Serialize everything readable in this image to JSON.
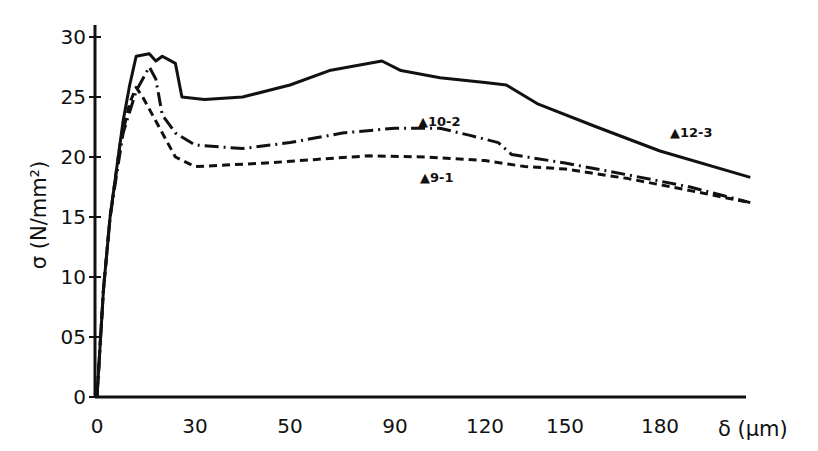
{
  "chart_data": {
    "type": "line",
    "title": "",
    "xlabel": "δ (μm)",
    "ylabel": "σ (N/mm²)",
    "x_ticks": [
      "0",
      "30",
      "50",
      "90",
      "120",
      "150",
      "180"
    ],
    "y_ticks": [
      "0",
      "05",
      "10",
      "15",
      "20",
      "25",
      "30"
    ],
    "ylim": [
      0,
      3.0
    ],
    "grid": false,
    "legend": "inline labels",
    "series": [
      {
        "name": "▲12-3",
        "style": "solid",
        "points": [
          [
            0,
            0.0
          ],
          [
            2,
            0.9
          ],
          [
            4,
            1.5
          ],
          [
            8,
            2.3
          ],
          [
            10,
            2.6
          ],
          [
            12,
            2.84
          ],
          [
            16,
            2.86
          ],
          [
            18,
            2.8
          ],
          [
            20,
            2.84
          ],
          [
            24,
            2.78
          ],
          [
            26,
            2.5
          ],
          [
            32,
            2.48
          ],
          [
            40,
            2.5
          ],
          [
            50,
            2.6
          ],
          [
            65,
            2.72
          ],
          [
            85,
            2.8
          ],
          [
            92,
            2.72
          ],
          [
            105,
            2.66
          ],
          [
            120,
            2.62
          ],
          [
            128,
            2.6
          ],
          [
            140,
            2.44
          ],
          [
            160,
            2.25
          ],
          [
            180,
            2.05
          ],
          [
            195,
            1.83
          ]
        ]
      },
      {
        "name": "▲10-2",
        "style": "dash-dot",
        "points": [
          [
            0,
            0.0
          ],
          [
            2,
            0.9
          ],
          [
            4,
            1.5
          ],
          [
            8,
            2.2
          ],
          [
            12,
            2.55
          ],
          [
            16,
            2.75
          ],
          [
            18,
            2.65
          ],
          [
            20,
            2.35
          ],
          [
            24,
            2.2
          ],
          [
            30,
            2.1
          ],
          [
            40,
            2.07
          ],
          [
            50,
            2.12
          ],
          [
            70,
            2.2
          ],
          [
            90,
            2.24
          ],
          [
            105,
            2.24
          ],
          [
            115,
            2.18
          ],
          [
            125,
            2.12
          ],
          [
            130,
            2.02
          ],
          [
            150,
            1.95
          ],
          [
            170,
            1.85
          ],
          [
            185,
            1.75
          ],
          [
            195,
            1.62
          ]
        ]
      },
      {
        "name": "▲9-1",
        "style": "dashed",
        "points": [
          [
            0,
            0.0
          ],
          [
            2,
            0.9
          ],
          [
            4,
            1.5
          ],
          [
            7,
            2.1
          ],
          [
            10,
            2.45
          ],
          [
            12,
            2.58
          ],
          [
            14,
            2.5
          ],
          [
            18,
            2.3
          ],
          [
            24,
            2.0
          ],
          [
            30,
            1.92
          ],
          [
            45,
            1.95
          ],
          [
            60,
            1.98
          ],
          [
            80,
            2.01
          ],
          [
            100,
            2.0
          ],
          [
            120,
            1.97
          ],
          [
            135,
            1.92
          ],
          [
            150,
            1.9
          ],
          [
            170,
            1.82
          ],
          [
            185,
            1.72
          ],
          [
            195,
            1.62
          ]
        ]
      }
    ],
    "annotations": [
      {
        "text": "▲12-3",
        "near_series": "▲12-3"
      },
      {
        "text": "▲10-2",
        "near_series": "▲10-2"
      },
      {
        "text": "▲9-1",
        "near_series": "▲9-1"
      }
    ]
  }
}
